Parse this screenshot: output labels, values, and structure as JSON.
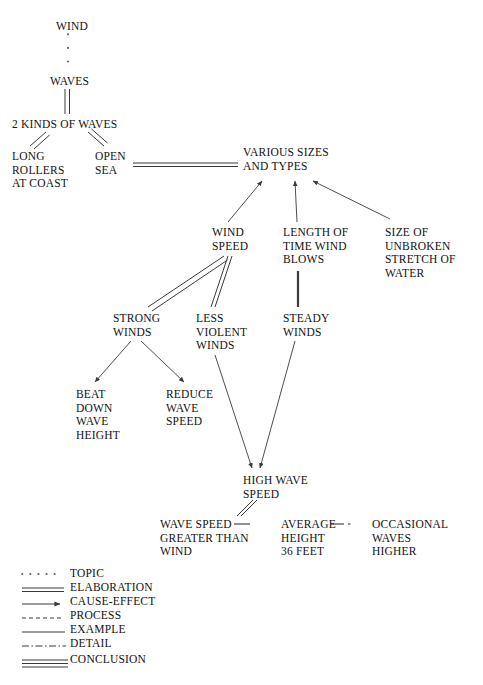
{
  "diagram": {
    "nodes": [
      {
        "id": "wind",
        "text": "WIND",
        "x": 56,
        "y": 20
      },
      {
        "id": "waves",
        "text": "WAVES",
        "x": 50,
        "y": 75
      },
      {
        "id": "two_kinds",
        "text": "2 KINDS OF WAVES",
        "x": 12,
        "y": 118
      },
      {
        "id": "long_rollers",
        "text": "LONG\nROLLERS\nAT COAST",
        "x": 12,
        "y": 150
      },
      {
        "id": "open_sea",
        "text": "OPEN\nSEA",
        "x": 95,
        "y": 150
      },
      {
        "id": "various",
        "text": "VARIOUS SIZES\nAND TYPES",
        "x": 243,
        "y": 146
      },
      {
        "id": "wind_speed",
        "text": "WIND\nSPEED",
        "x": 212,
        "y": 226
      },
      {
        "id": "length_time",
        "text": "LENGTH OF\nTIME WIND\nBLOWS",
        "x": 283,
        "y": 226
      },
      {
        "id": "size_stretch",
        "text": "SIZE OF\nUNBROKEN\nSTRETCH OF\nWATER",
        "x": 385,
        "y": 226
      },
      {
        "id": "strong",
        "text": "STRONG\nWINDS",
        "x": 113,
        "y": 312
      },
      {
        "id": "less_violent",
        "text": "LESS\nVIOLENT\nWINDS",
        "x": 196,
        "y": 312
      },
      {
        "id": "steady",
        "text": "STEADY\nWINDS",
        "x": 283,
        "y": 312
      },
      {
        "id": "beat_down",
        "text": "BEAT\nDOWN\nWAVE\nHEIGHT",
        "x": 76,
        "y": 388
      },
      {
        "id": "reduce",
        "text": "REDUCE\nWAVE\nSPEED",
        "x": 166,
        "y": 388
      },
      {
        "id": "high_wave",
        "text": "HIGH WAVE\nSPEED",
        "x": 243,
        "y": 474
      },
      {
        "id": "wave_greater",
        "text": "WAVE SPEED\nGREATER THAN\nWIND",
        "x": 160,
        "y": 518
      },
      {
        "id": "average",
        "text": "AVERAGE\nHEIGHT\n36 FEET",
        "x": 281,
        "y": 518
      },
      {
        "id": "occasional",
        "text": "OCCASIONAL\nWAVES\nHIGHER",
        "x": 372,
        "y": 518
      }
    ],
    "edges": [
      {
        "from": "wind",
        "to": "waves",
        "style": "topic"
      },
      {
        "from": "waves",
        "to": "two_kinds",
        "style": "elaboration"
      },
      {
        "from": "two_kinds",
        "to": "long_rollers",
        "style": "elaboration"
      },
      {
        "from": "two_kinds",
        "to": "open_sea",
        "style": "elaboration"
      },
      {
        "from": "open_sea",
        "to": "various",
        "style": "elaboration"
      },
      {
        "from": "wind_speed",
        "to": "various",
        "style": "cause-effect"
      },
      {
        "from": "length_time",
        "to": "various",
        "style": "cause-effect"
      },
      {
        "from": "size_stretch",
        "to": "various",
        "style": "cause-effect"
      },
      {
        "from": "wind_speed",
        "to": "strong",
        "style": "elaboration"
      },
      {
        "from": "wind_speed",
        "to": "less_violent",
        "style": "elaboration"
      },
      {
        "from": "length_time",
        "to": "steady",
        "style": "example"
      },
      {
        "from": "strong",
        "to": "beat_down",
        "style": "cause-effect"
      },
      {
        "from": "strong",
        "to": "reduce",
        "style": "cause-effect"
      },
      {
        "from": "less_violent",
        "to": "high_wave",
        "style": "cause-effect"
      },
      {
        "from": "steady",
        "to": "high_wave",
        "style": "cause-effect"
      },
      {
        "from": "high_wave",
        "to": "wave_greater",
        "style": "elaboration"
      },
      {
        "from": "wave_greater",
        "to": "average",
        "style": "detail"
      },
      {
        "from": "average",
        "to": "occasional",
        "style": "detail"
      }
    ]
  },
  "legend": {
    "items": [
      {
        "key": "topic",
        "label": "TOPIC",
        "line": "dotted"
      },
      {
        "key": "elaboration",
        "label": "ELABORATION",
        "line": "double"
      },
      {
        "key": "cause-effect",
        "label": "CAUSE-EFFECT",
        "line": "arrow"
      },
      {
        "key": "process",
        "label": "PROCESS",
        "line": "dashed"
      },
      {
        "key": "example",
        "label": "EXAMPLE",
        "line": "solid"
      },
      {
        "key": "detail",
        "label": "DETAIL",
        "line": "dash-dot"
      },
      {
        "key": "conclusion",
        "label": "CONCLUSION",
        "line": "triple"
      }
    ]
  },
  "colors": {
    "ink": "#111111",
    "line": "#3a3a3a",
    "background": "#ffffff"
  }
}
